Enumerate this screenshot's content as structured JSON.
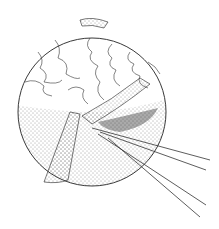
{
  "illustration": {
    "subject": "sphere-with-strip-peeled-by-forceps",
    "colors": {
      "ink": "#222222",
      "background": "#ffffff",
      "stipple": "#333333"
    }
  }
}
